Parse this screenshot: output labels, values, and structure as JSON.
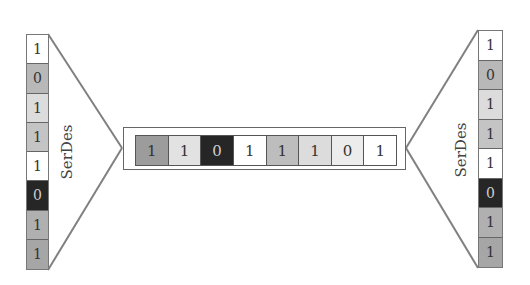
{
  "diagram": {
    "title": "",
    "left_stack": {
      "label": "SerDes",
      "bits": [
        "1",
        "0",
        "1",
        "1",
        "1",
        "0",
        "1",
        "1"
      ],
      "colors": [
        "#ffffff",
        "#b8b8b8",
        "#dcdcdc",
        "#c4c4c4",
        "#ffffff",
        "#262626",
        "#b0b0b0",
        "#a6a6a6"
      ]
    },
    "center_strip": {
      "bits": [
        "1",
        "1",
        "0",
        "1",
        "1",
        "1",
        "0",
        "1"
      ],
      "colors": [
        "#9c9c9c",
        "#e2e2e2",
        "#262626",
        "#ffffff",
        "#bdbdbd",
        "#dcdcdc",
        "#ececec",
        "#ffffff"
      ]
    },
    "right_stack": {
      "label": "SerDes",
      "bits": [
        "1",
        "0",
        "1",
        "1",
        "1",
        "0",
        "1",
        "1"
      ],
      "colors": [
        "#ffffff",
        "#b8b8b8",
        "#dcdcdc",
        "#c4c4c4",
        "#ffffff",
        "#262626",
        "#b0b0b0",
        "#a6a6a6"
      ]
    },
    "line_color": "#7a7a7a"
  }
}
